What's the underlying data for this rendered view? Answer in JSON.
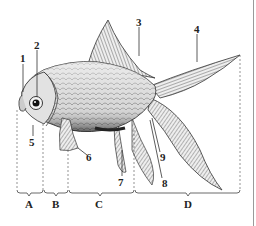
{
  "diagram": {
    "part_labels": [
      {
        "id": "1",
        "x": 20,
        "y": 63
      },
      {
        "id": "2",
        "x": 34,
        "y": 40
      },
      {
        "id": "3",
        "x": 137,
        "y": 18
      },
      {
        "id": "4",
        "x": 194,
        "y": 25
      },
      {
        "id": "5",
        "x": 29,
        "y": 137
      },
      {
        "id": "6",
        "x": 86,
        "y": 153
      },
      {
        "id": "7",
        "x": 118,
        "y": 177
      },
      {
        "id": "8",
        "x": 163,
        "y": 178
      },
      {
        "id": "9",
        "x": 160,
        "y": 152
      }
    ],
    "segment_labels": [
      {
        "id": "A",
        "x": 25,
        "y": 200
      },
      {
        "id": "B",
        "x": 52,
        "y": 200
      },
      {
        "id": "C",
        "x": 95,
        "y": 200
      },
      {
        "id": "D",
        "x": 185,
        "y": 200
      }
    ]
  }
}
